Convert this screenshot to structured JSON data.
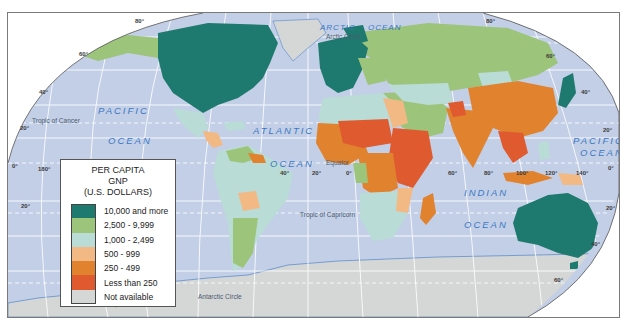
{
  "legend": {
    "title_line1": "PER CAPITA",
    "title_line2": "GNP",
    "title_line3": "(U.S. DOLLARS)",
    "items": [
      {
        "label": "10,000 and more",
        "color": "#1e7a6e"
      },
      {
        "label": "2,500 - 9,999",
        "color": "#9cc47a"
      },
      {
        "label": "1,000 - 2,499",
        "color": "#b9dcd6"
      },
      {
        "label": "500 - 999",
        "color": "#f2b985"
      },
      {
        "label": "250 - 499",
        "color": "#e0822e"
      },
      {
        "label": "Less than 250",
        "color": "#df5a2e"
      },
      {
        "label": "Not available",
        "color": "#d5d6d6"
      }
    ]
  },
  "oceans": {
    "pacific_west_1": "PACIFIC",
    "pacific_west_2": "OCEAN",
    "atlantic_1": "ATLANTIC",
    "atlantic_2": "OCEAN",
    "indian_1": "INDIAN",
    "indian_2": "OCEAN",
    "pacific_east_1": "PACIFIC",
    "pacific_east_2": "OCEAN",
    "arctic_1": "ARCTIC",
    "arctic_2": "OCEAN"
  },
  "lines": {
    "arctic_circle": "Arctic Circle",
    "tropic_cancer": "Tropic of Cancer",
    "equator": "Equator",
    "tropic_capricorn": "Tropic of Capricorn",
    "antarctic_circle": "Antarctic Circle"
  },
  "degrees": {
    "lat_80_w": "80°",
    "lat_60_w": "60°",
    "lat_40_w": "40°",
    "lat_20_w": "20°",
    "lat_0_w": "0°",
    "lat_20s_w": "20°",
    "lon_180": "180°",
    "lon_40": "40°",
    "lon_20": "20°",
    "lon_0": "0°",
    "lon_60": "60°",
    "lon_80": "80°",
    "lon_100": "100°",
    "lon_120": "120°",
    "lon_140": "140°",
    "lat_80_e": "80°",
    "lat_60_e": "60°",
    "lat_40_e": "40°",
    "lat_20_e": "20°",
    "lat_0_e": "0°",
    "lat_20s_e": "20°",
    "lat_40s_e": "40°",
    "lat_60s_e": "60°"
  },
  "colors": {
    "ocean": "#c3cfe6",
    "grid": "#ffffff",
    "antarctica": "#d5d6d6",
    "water_accent": "#3a78c4"
  }
}
